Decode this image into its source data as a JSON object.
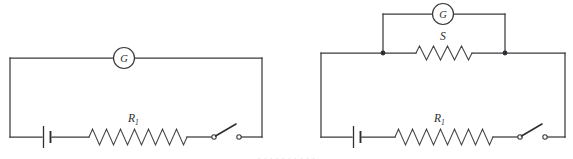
{
  "figure": {
    "background_color": "#ffffff",
    "line_color": "#3a3a3e",
    "width": 573,
    "height": 159,
    "partial_caption_bleed": "· · · · · · · · · ·"
  },
  "circuits": [
    {
      "id": "circuit-left",
      "name": "galvanometer-series-circuit",
      "frame": {
        "x": 10,
        "y": 58,
        "width": 252,
        "height": 79
      },
      "components": {
        "galvanometer": {
          "label": "G",
          "cx": 124,
          "cy": 58,
          "r": 10.5,
          "name": "galvanometer"
        },
        "battery": {
          "label": "",
          "cx": 47,
          "cy": 137,
          "name": "battery-cell"
        },
        "resistor": {
          "label": "R",
          "sublabel": "1",
          "x": 89,
          "y": 137,
          "width": 98,
          "peaks": 7,
          "amplitude": 8,
          "name": "resistor-r1"
        },
        "switch": {
          "label": "",
          "x1": 212,
          "x2": 239,
          "y": 137,
          "name": "open-switch"
        }
      }
    },
    {
      "id": "circuit-right",
      "name": "galvanometer-shunt-circuit",
      "frame": {
        "x": 321,
        "y": 53,
        "width": 244,
        "height": 84
      },
      "components": {
        "galvanometer": {
          "label": "G",
          "cx": 443,
          "cy": 14,
          "r": 10.5,
          "name": "galvanometer"
        },
        "shunt_resistor": {
          "label": "S",
          "x": 416,
          "y": 53,
          "width": 56,
          "peaks": 4,
          "amplitude": 7,
          "name": "resistor-shunt-s"
        },
        "junction_left": {
          "cx": 383,
          "cy": 53,
          "r": 2.2,
          "name": "junction-dot-left"
        },
        "junction_right": {
          "cx": 505,
          "cy": 53,
          "r": 2.2,
          "name": "junction-dot-right"
        },
        "meter_branch": {
          "left_x": 383,
          "right_x": 505,
          "top_y": 14,
          "name": "galvanometer-branch"
        },
        "battery": {
          "label": "",
          "cx": 357,
          "cy": 137,
          "name": "battery-cell"
        },
        "resistor": {
          "label": "R",
          "sublabel": "1",
          "x": 395,
          "y": 137,
          "width": 98,
          "peaks": 7,
          "amplitude": 8,
          "name": "resistor-r1"
        },
        "switch": {
          "label": "",
          "x1": 518,
          "x2": 545,
          "y": 137,
          "name": "open-switch"
        }
      }
    }
  ],
  "labels": {
    "left_galvanometer": "G",
    "left_resistor_main": "R",
    "left_resistor_sub": "1",
    "right_galvanometer": "G",
    "right_shunt": "S",
    "right_resistor_main": "R",
    "right_resistor_sub": "1"
  }
}
